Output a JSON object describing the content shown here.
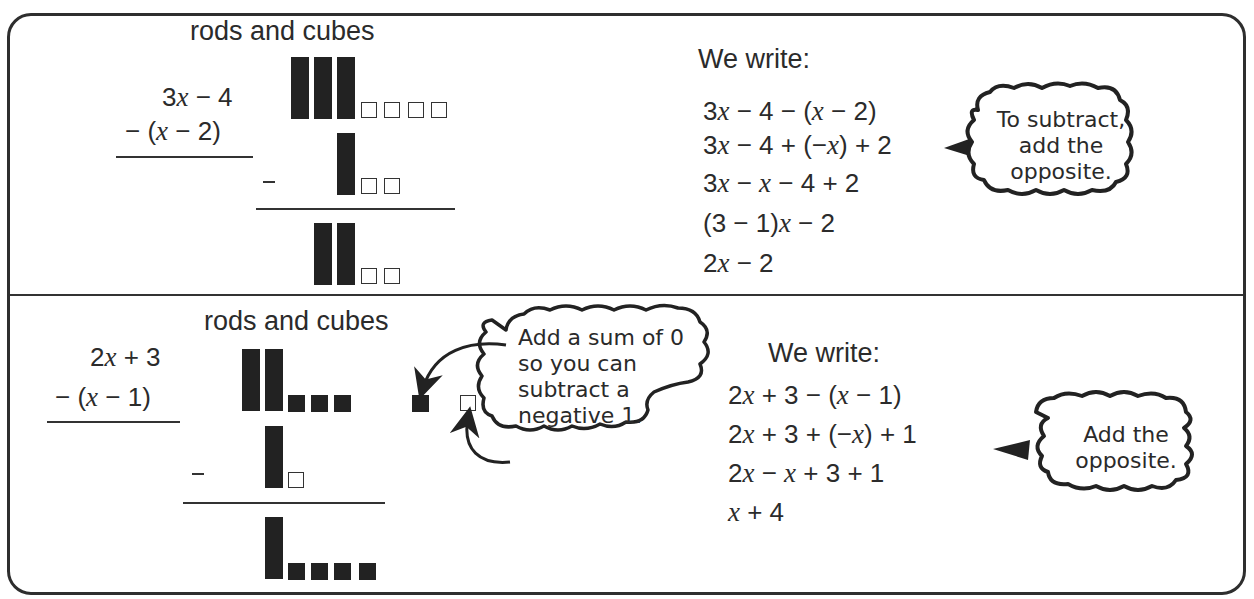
{
  "top": {
    "heading": "rods and cubes",
    "problem": {
      "line1": {
        "pre": "3",
        "var": "x",
        "post": " − 4"
      },
      "line2": {
        "pre": "−  (",
        "var": "x",
        "post": " − 2)"
      }
    },
    "we_write_label": "We write:",
    "steps": [
      {
        "parts": [
          "3",
          "x",
          " − 4 − (",
          "x",
          " − 2)"
        ]
      },
      {
        "parts": [
          "3",
          "x",
          " − 4 + (−",
          "x",
          ") + 2"
        ]
      },
      {
        "parts": [
          "3",
          "x",
          " − ",
          "x",
          " − 4 + 2"
        ]
      },
      {
        "parts": [
          "(3 − 1)",
          "x",
          " − 2",
          "",
          ""
        ]
      },
      {
        "parts": [
          "2",
          "x",
          " − 2",
          "",
          ""
        ]
      }
    ],
    "bubble": {
      "line1": "To subtract,",
      "line2": "add the",
      "line3": "opposite."
    },
    "model": {
      "minuend": {
        "rods": 3,
        "cubes": 4,
        "cube_type": "negative"
      },
      "subtrahend": {
        "rods": 1,
        "cubes": 2,
        "cube_type": "negative"
      },
      "difference": {
        "rods": 2,
        "cubes": 2,
        "cube_type": "negative"
      }
    }
  },
  "bottom": {
    "heading": "rods and cubes",
    "problem": {
      "line1": {
        "pre": "2",
        "var": "x",
        "post": " + 3"
      },
      "line2": {
        "pre": "−  (",
        "var": "x",
        "post": " − 1)"
      }
    },
    "we_write_label": "We write:",
    "steps": [
      {
        "parts": [
          "2",
          "x",
          " + 3 − (",
          "x",
          " − 1)"
        ]
      },
      {
        "parts": [
          "2",
          "x",
          " + 3 + (−",
          "x",
          ") + 1"
        ]
      },
      {
        "parts": [
          "2",
          "x",
          " − ",
          "x",
          " + 3 + 1"
        ]
      },
      {
        "parts": [
          "",
          "x",
          " + 4",
          "",
          ""
        ]
      }
    ],
    "bubble_zero": {
      "line1": "Add a sum of 0",
      "line2": "so you can",
      "line3": "subtract a",
      "line4": "negative 1."
    },
    "bubble_opposite": {
      "line1": "Add the",
      "line2": "opposite."
    },
    "model": {
      "minuend": {
        "rods": 2,
        "cubes": 3,
        "cube_type": "positive"
      },
      "zero_pair": {
        "positive": 1,
        "negative": 1
      },
      "subtrahend": {
        "rods": 1,
        "cubes": 1,
        "cube_type": "negative"
      },
      "difference": {
        "rods": 1,
        "cubes": 4,
        "cube_type": "positive"
      }
    }
  },
  "colors": {
    "ink": "#2b2b2b",
    "block": "#222222",
    "background": "#ffffff"
  }
}
